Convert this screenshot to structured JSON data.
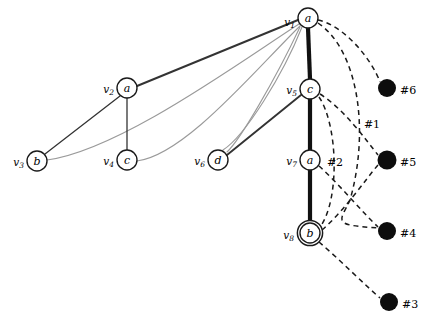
{
  "figure": {
    "type": "graph-diagram",
    "background": "#ffffff",
    "width": 422,
    "height": 323
  },
  "palette": {
    "node_stroke": "#1a1a1a",
    "node_fill": "#ffffff",
    "black_node_fill": "#0d0d0d",
    "edge_thick": "#111111",
    "edge_thin": "#333333",
    "edge_gray": "#9a9a9a",
    "edge_dashed": "#1a1a1a",
    "text": "#000000"
  },
  "nodes": [
    {
      "id": "v1",
      "name": "v",
      "sub": "1",
      "letter": "a",
      "cx": 308,
      "cy": 18,
      "r": 10,
      "double": false,
      "label_dx": -13,
      "label_dy": 4
    },
    {
      "id": "v2",
      "name": "v",
      "sub": "2",
      "letter": "a",
      "cx": 127,
      "cy": 88,
      "r": 10,
      "double": false,
      "label_dx": -13,
      "label_dy": 1
    },
    {
      "id": "v3",
      "name": "v",
      "sub": "3",
      "letter": "b",
      "cx": 37,
      "cy": 161,
      "r": 10,
      "double": false,
      "label_dx": -13,
      "label_dy": 1
    },
    {
      "id": "v4",
      "name": "v",
      "sub": "4",
      "letter": "c",
      "cx": 127,
      "cy": 160,
      "r": 10,
      "double": false,
      "label_dx": -13,
      "label_dy": 1
    },
    {
      "id": "v5",
      "name": "v",
      "sub": "5",
      "letter": "c",
      "cx": 310,
      "cy": 89,
      "r": 10,
      "double": false,
      "label_dx": -13,
      "label_dy": 1
    },
    {
      "id": "v6",
      "name": "v",
      "sub": "6",
      "letter": "d",
      "cx": 218,
      "cy": 160,
      "r": 10,
      "double": false,
      "label_dx": -13,
      "label_dy": 1
    },
    {
      "id": "v7",
      "name": "v",
      "sub": "7",
      "letter": "a",
      "cx": 310,
      "cy": 160,
      "r": 10,
      "double": false,
      "label_dx": -13,
      "label_dy": 1
    },
    {
      "id": "v8",
      "name": "v",
      "sub": "8",
      "letter": "b",
      "cx": 310,
      "cy": 233,
      "r": 10,
      "double": true,
      "label_dx": -16,
      "label_dy": 2
    }
  ],
  "black_nodes": [
    {
      "id": "n6",
      "label": "#6",
      "cx": 387,
      "cy": 88,
      "r": 9,
      "label_dx": 13,
      "label_dy": 2
    },
    {
      "id": "n5",
      "label": "#5",
      "cx": 387,
      "cy": 160,
      "r": 9.5,
      "label_dx": 13,
      "label_dy": 2
    },
    {
      "id": "n4",
      "label": "#4",
      "cx": 387,
      "cy": 231,
      "r": 9,
      "label_dx": 13,
      "label_dy": 2
    },
    {
      "id": "n3",
      "label": "#3",
      "cx": 389,
      "cy": 302,
      "r": 9,
      "label_dx": 13,
      "label_dy": 2
    }
  ],
  "edges_thick": [
    {
      "id": "e-v1-v5",
      "from": "v1",
      "to": "v5",
      "d": "M 308 28 L 310 79",
      "width": 4.2
    },
    {
      "id": "e-v5-v7",
      "from": "v5",
      "to": "v7",
      "d": "M 310 99 L 310 150",
      "width": 4.2
    },
    {
      "id": "e-v7-v8",
      "from": "v7",
      "to": "v8",
      "d": "M 310 170 L 310 221",
      "width": 4.2
    }
  ],
  "edges_solid": [
    {
      "id": "e-v1-v2",
      "from": "v1",
      "to": "v2",
      "d": "M 298 20 L 137 86",
      "width": 1.9
    },
    {
      "id": "e-v2-v3",
      "from": "v2",
      "to": "v3",
      "d": "M 120 96 L 45 154",
      "width": 1.3
    },
    {
      "id": "e-v2-v4",
      "from": "v2",
      "to": "v4",
      "d": "M 127 98 L 127 150",
      "width": 1.3
    },
    {
      "id": "e-v5-v6",
      "from": "v5",
      "to": "v6",
      "d": "M 301 95 L 227 155",
      "width": 1.9
    }
  ],
  "edges_gray": [
    {
      "id": "g-v1-v3",
      "from": "v1",
      "to": "v3",
      "d": "M 299 24 C 240 62, 120 150, 47 160",
      "width": 1.1
    },
    {
      "id": "g-v1-v4",
      "from": "v1",
      "to": "v4",
      "d": "M 300 26 C 255 70, 185 155, 137 161",
      "width": 1.1
    },
    {
      "id": "g-v1-v6a",
      "from": "v1",
      "to": "v6",
      "d": "M 302 27 C 283 75, 245 136, 223 150",
      "width": 1.1
    },
    {
      "id": "g-v1-v6b",
      "from": "v1",
      "to": "v6",
      "d": "M 300 27 C 275 80, 240 140, 227 152",
      "width": 1.1
    }
  ],
  "edges_dashed": [
    {
      "id": "d-v1-n6",
      "from": "v1",
      "to": "n6",
      "d": "M 318 20 C 345 26, 372 60, 380 82",
      "dash": "5 4"
    },
    {
      "id": "d-v1-long",
      "from": "v1",
      "to": "n4",
      "d": "M 318 23 C 358 50, 370 130, 350 200, 340 222, 330 225, 379 228",
      "dash": "5 4"
    },
    {
      "id": "d-v5-n5",
      "from": "v5",
      "to": "n5",
      "d": "M 320 94 C 345 110, 366 140, 378 155",
      "dash": "5 4"
    },
    {
      "id": "d-v5-v8",
      "from": "v5",
      "to": "v8",
      "d": "M 319 97 C 338 125, 340 200, 320 227",
      "dash": "5 4"
    },
    {
      "id": "d-v7-n4",
      "from": "v7",
      "to": "n4",
      "d": "M 319 166 C 340 185, 362 212, 378 227",
      "dash": "5 4"
    },
    {
      "id": "d-v8-n5",
      "from": "v8",
      "to": "n5",
      "d": "M 322 230 C 345 210, 365 180, 378 165",
      "dash": "5 4"
    },
    {
      "id": "d-v8-n3",
      "from": "v8",
      "to": "n3",
      "d": "M 319 242 C 340 260, 365 285, 380 298",
      "dash": "5 4"
    }
  ],
  "edge_labels": [
    {
      "id": "lbl-1",
      "text": "#1",
      "x": 372,
      "y": 124
    },
    {
      "id": "lbl-2",
      "text": "#2",
      "x": 335,
      "y": 162
    }
  ]
}
